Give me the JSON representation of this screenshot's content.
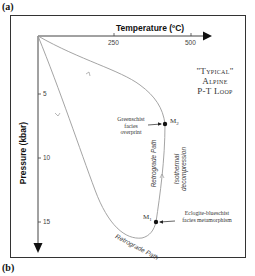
{
  "figure": {
    "panel_a": "(a)",
    "panel_b": "(b)",
    "title_lines": [
      "\"Typical\"",
      "Alpine",
      "P-T Loop"
    ]
  },
  "axes": {
    "x_title": "Temperature (ºC)",
    "x_ticks": [
      "250",
      "500"
    ],
    "y_title": "Pressure (kbar)",
    "y_ticks": [
      "5",
      "10",
      "15"
    ]
  },
  "points": {
    "m2": {
      "label": "M",
      "sub": "2"
    },
    "m1": {
      "label": "M",
      "sub": "1"
    }
  },
  "annotations": {
    "greenschist": [
      "Greenschist",
      "facies",
      "overprint"
    ],
    "eclogite": [
      "Eclogite-blueschist",
      "facies metamorphism"
    ],
    "retrograde_vertical": "Retrograde Path",
    "isothermal": [
      "Isothermal",
      "decompression"
    ],
    "retrograde_bottom": "Retrograde Path"
  },
  "colors": {
    "frame": "#333333",
    "axis": "#444444",
    "curve": "#9a9a9a",
    "point": "#111111"
  }
}
